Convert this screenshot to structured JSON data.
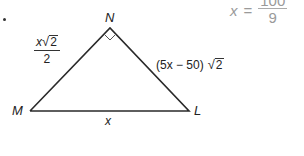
{
  "problem": {
    "bullet": "•",
    "vertices": {
      "N": "N",
      "M": "M",
      "L": "L"
    },
    "sides": {
      "MN": {
        "numerator_var": "x",
        "radicand": "2",
        "denominator": "2"
      },
      "NL": {
        "expression": "(5x − 50)",
        "radicand": "2"
      },
      "ML": {
        "expression": "x"
      }
    },
    "right_angle_at": "N"
  },
  "answer": {
    "variable": "x",
    "equals": "=",
    "numerator": "100",
    "denominator": "9"
  },
  "colors": {
    "line": "#2a2a2a",
    "text": "#222222",
    "answer_text": "#9a9a9a"
  }
}
